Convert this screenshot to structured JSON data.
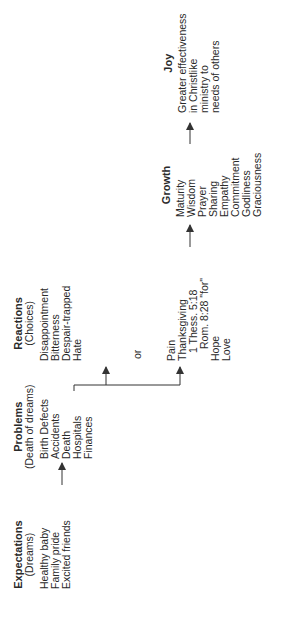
{
  "diagram": {
    "expectations": {
      "title": "Expectations",
      "subtitle": "(Dreams)",
      "items": [
        "Healthy baby",
        "Family pride",
        "Excited friends"
      ]
    },
    "problems": {
      "title": "Problems",
      "subtitle": "(Death of dreams)",
      "items": [
        "Birth Defects",
        "Accidents",
        "Death",
        "Hospitals",
        "Finances"
      ]
    },
    "reactions": {
      "title": "Reactions",
      "subtitle": "(Choices)",
      "items": [
        "Disappointment",
        "Bitterness",
        "Despair-trapped",
        "Hate"
      ]
    },
    "or_label": "or",
    "positive_reactions": {
      "items": [
        "Pain",
        "Thanksgiving",
        "1 Thess. 5:18",
        "Rom. 8:28 \"for\"",
        "Hope",
        "Love"
      ]
    },
    "growth": {
      "title": "Growth",
      "items": [
        "Maturity",
        "Wisdom",
        "Prayer",
        "Sharing",
        "Empathy",
        "Commitment",
        "Godliness",
        "Graciousness"
      ]
    },
    "joy": {
      "title": "Joy",
      "items": [
        "Greater effectiveness",
        "in Christlike",
        "ministry to",
        "needs of others"
      ]
    },
    "colors": {
      "text": "#2a2a2a",
      "line": "#333333",
      "background": "#ffffff"
    }
  }
}
